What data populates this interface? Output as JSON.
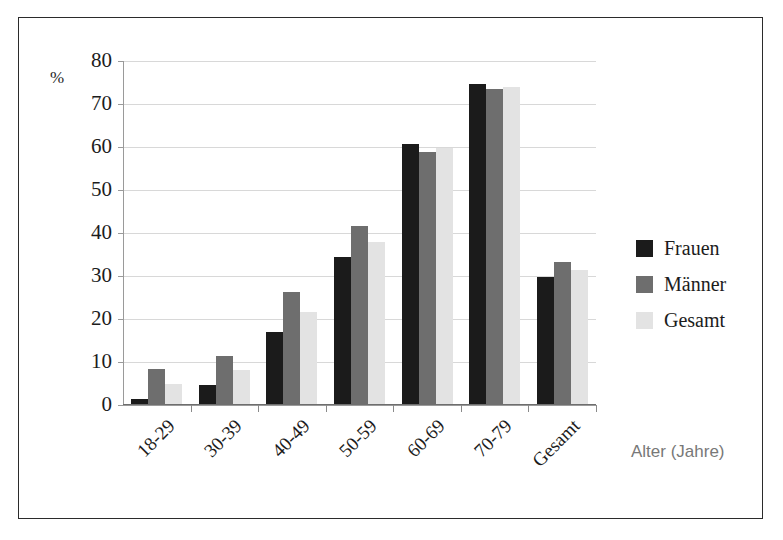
{
  "chart_data": {
    "type": "bar",
    "title": "",
    "subtitle": "",
    "xlabel": "Alter (Jahre)",
    "ylabel": "%",
    "ylim": [
      0,
      80
    ],
    "ytick_step": 10,
    "yticks": [
      "80",
      "70",
      "60",
      "50",
      "40",
      "30",
      "20",
      "10",
      "0"
    ],
    "ytick_values": [
      80,
      70,
      60,
      50,
      40,
      30,
      20,
      10,
      0
    ],
    "grid": true,
    "grid_axis": "y",
    "legend_position": "right",
    "categories": [
      "18-29",
      "30-39",
      "40-49",
      "50-59",
      "60-69",
      "70-79",
      "Gesamt"
    ],
    "series": [
      {
        "name": "Frauen",
        "color": "#1b1b1b",
        "values": [
          1.3,
          4.7,
          17.0,
          34.5,
          60.6,
          74.6,
          29.7
        ]
      },
      {
        "name": "Männer",
        "color": "#6e6e6e",
        "values": [
          8.3,
          11.3,
          26.2,
          41.6,
          58.8,
          73.4,
          33.3
        ]
      },
      {
        "name": "Gesamt",
        "color": "#e3e3e3",
        "values": [
          4.9,
          8.1,
          21.7,
          37.9,
          59.7,
          74.0,
          31.5
        ]
      }
    ]
  },
  "legend": {
    "items": [
      {
        "label": "Frauen",
        "color": "#1b1b1b"
      },
      {
        "label": "Männer",
        "color": "#6e6e6e"
      },
      {
        "label": "Gesamt",
        "color": "#e3e3e3"
      }
    ]
  },
  "axes": {
    "y_unit_label": "%",
    "x_axis_title": "Alter (Jahre)"
  },
  "colors": {
    "frame_border": "#2b2b2b",
    "gridline": "#d8d8d8",
    "axis_line": "#9a9a9a",
    "tick_text": "#1c1c1c",
    "axis_title_text": "#787878",
    "background": "#ffffff"
  }
}
